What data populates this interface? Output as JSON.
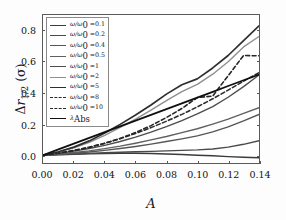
{
  "chart_data": {
    "type": "line",
    "title": "",
    "xlabel": "A",
    "ylabel": "Δr_{1/2} (σ)",
    "xlim": [
      0.0,
      0.14
    ],
    "ylim": [
      -0.05,
      0.9
    ],
    "grid": false,
    "legend_position": "upper left",
    "xticks": [
      "0.00",
      "0.02",
      "0.04",
      "0.06",
      "0.08",
      "0.10",
      "0.12",
      "0.14"
    ],
    "xtick_values": [
      0.0,
      0.02,
      0.04,
      0.06,
      0.08,
      0.1,
      0.12,
      0.14
    ],
    "yticks": [
      "0.0",
      "0.2",
      "0.4",
      "0.6",
      "0.8"
    ],
    "ytick_values": [
      0.0,
      0.2,
      0.4,
      0.6,
      0.8
    ],
    "x": [
      0.0,
      0.01,
      0.02,
      0.03,
      0.04,
      0.05,
      0.06,
      0.07,
      0.08,
      0.09,
      0.1,
      0.11,
      0.12,
      0.13,
      0.14
    ],
    "series": [
      {
        "name": "ω/ω₀ = 0.1",
        "label_prefix": "ω/ω",
        "label_sub": "0",
        "label_value": "0.1",
        "style": "solid",
        "color": "#3b3b3b",
        "width": 1.5,
        "values": [
          0.0,
          0.003,
          0.006,
          0.009,
          0.011,
          0.012,
          0.012,
          0.011,
          0.008,
          0.004,
          0.0,
          -0.004,
          -0.009,
          -0.013,
          -0.016
        ]
      },
      {
        "name": "ω/ω₀ = 0.2",
        "label_prefix": "ω/ω",
        "label_sub": "0",
        "label_value": "0.2",
        "style": "solid",
        "color": "#4a4a4a",
        "width": 1.4,
        "values": [
          0.0,
          0.004,
          0.008,
          0.012,
          0.016,
          0.019,
          0.022,
          0.025,
          0.028,
          0.031,
          0.034,
          0.04,
          0.052,
          0.07,
          0.093
        ]
      },
      {
        "name": "ω/ω₀ = 0.4",
        "label_prefix": "ω/ω",
        "label_sub": "0",
        "label_value": "0.4",
        "style": "solid",
        "color": "#565656",
        "width": 1.4,
        "values": [
          0.0,
          0.006,
          0.013,
          0.021,
          0.031,
          0.043,
          0.056,
          0.071,
          0.088,
          0.105,
          0.124,
          0.15,
          0.182,
          0.22,
          0.262
        ]
      },
      {
        "name": "ω/ω₀ = 0.5",
        "label_prefix": "ω/ω",
        "label_sub": "0",
        "label_value": "0.5",
        "style": "solid",
        "color": "#606060",
        "width": 1.4,
        "values": [
          0.0,
          0.008,
          0.017,
          0.028,
          0.042,
          0.058,
          0.077,
          0.098,
          0.12,
          0.145,
          0.17,
          0.2,
          0.232,
          0.268,
          0.305
        ]
      },
      {
        "name": "ω/ω₀ = 1",
        "label_prefix": "ω/ω",
        "label_sub": "0",
        "label_value": "1",
        "style": "solid",
        "color": "#4d4d4d",
        "width": 1.4,
        "values": [
          0.0,
          0.012,
          0.026,
          0.043,
          0.063,
          0.088,
          0.116,
          0.148,
          0.183,
          0.222,
          0.265,
          0.312,
          0.372,
          0.44,
          0.515
        ]
      },
      {
        "name": "ω/ω₀ = 2",
        "label_prefix": "ω/ω",
        "label_sub": "0",
        "label_value": "2",
        "style": "solid",
        "color": "#8f8f8f",
        "width": 1.4,
        "values": [
          0.0,
          0.02,
          0.047,
          0.082,
          0.127,
          0.178,
          0.232,
          0.29,
          0.35,
          0.408,
          0.455,
          0.52,
          0.6,
          0.695,
          0.762
        ]
      },
      {
        "name": "ω/ω₀ = 5",
        "label_prefix": "ω/ω",
        "label_sub": "0",
        "label_value": "5",
        "style": "solid",
        "color": "#2e2e2e",
        "width": 1.7,
        "values": [
          0.0,
          0.022,
          0.052,
          0.092,
          0.142,
          0.198,
          0.258,
          0.322,
          0.392,
          0.452,
          0.49,
          0.56,
          0.64,
          0.735,
          0.83
        ]
      },
      {
        "name": "ω/ω₀ = 8",
        "label_prefix": "ω/ω",
        "label_sub": "0",
        "label_value": "8",
        "style": "dashed",
        "color": "#2b2b2b",
        "width": 1.6,
        "values": [
          0.0,
          0.014,
          0.031,
          0.052,
          0.077,
          0.106,
          0.14,
          0.177,
          0.218,
          0.262,
          0.31,
          0.362,
          0.418,
          0.475,
          0.53
        ]
      },
      {
        "name": "ω/ω₀ = 10",
        "label_prefix": "ω/ω",
        "label_sub": "0",
        "label_value": "10",
        "style": "dashed",
        "color": "#262626",
        "width": 1.6,
        "values": [
          0.0,
          0.013,
          0.029,
          0.05,
          0.076,
          0.108,
          0.146,
          0.19,
          0.242,
          0.3,
          0.37,
          0.38,
          0.51,
          0.64,
          0.638
        ]
      },
      {
        "name": "λ_Abs",
        "label_prefix": "λ",
        "label_sub": "Abs",
        "label_value": "",
        "style": "solid",
        "color": "#111111",
        "width": 1.8,
        "values": [
          0.0,
          0.037,
          0.074,
          0.111,
          0.148,
          0.185,
          0.222,
          0.259,
          0.296,
          0.333,
          0.37,
          0.407,
          0.444,
          0.481,
          0.518
        ]
      }
    ]
  },
  "axes": {
    "x_title": "A",
    "y_title_delta": "Δ",
    "y_title_r": "r",
    "y_title_sub": "1/2",
    "y_title_unit": "(σ)"
  },
  "colors": {
    "frame": "#5a5a5a",
    "background": "#ffffff",
    "text": "#111111"
  }
}
